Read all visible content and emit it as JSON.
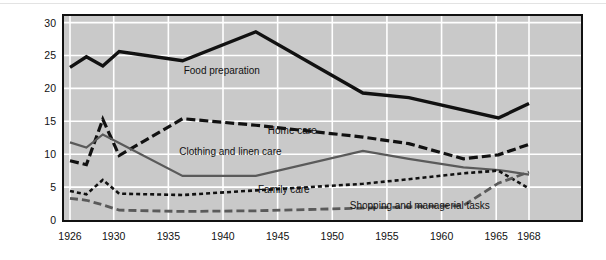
{
  "chart_data": {
    "type": "line",
    "title": "",
    "xlabel": "",
    "ylabel": "Hours per week",
    "xlim": [
      1926,
      1968
    ],
    "ylim": [
      0,
      31
    ],
    "grid": true,
    "legend_position": "inline-annotations",
    "xticks": [
      "1926",
      "1930",
      "1935",
      "1940",
      "1945",
      "1950",
      "1955",
      "1960",
      "1965",
      "1968"
    ],
    "xtick_values": [
      1926,
      1930,
      1935,
      1940,
      1945,
      1950,
      1955,
      1960,
      1965,
      1968
    ],
    "yticks": [
      "0",
      "5",
      "10",
      "15",
      "20",
      "25",
      "30"
    ],
    "ytick_values": [
      0,
      5,
      10,
      15,
      20,
      25,
      30
    ],
    "series": [
      {
        "name": "Food preparation",
        "style": "solid-thick-black",
        "color": "#111111",
        "label_x": 1936.4,
        "label_y": 22.6,
        "x": [
          1926,
          1927.5,
          1929,
          1930.5,
          1936.3,
          1943,
          1952.8,
          1957,
          1965.2,
          1968
        ],
        "values": [
          23.2,
          24.8,
          23.4,
          25.6,
          24.2,
          28.6,
          19.3,
          18.6,
          15.5,
          17.7
        ]
      },
      {
        "name": "Home care",
        "style": "dashed-long-black",
        "color": "#111111",
        "label_x": 1944.1,
        "label_y": 13.6,
        "x": [
          1926,
          1927.5,
          1929,
          1930.5,
          1936.3,
          1943,
          1952.8,
          1957,
          1962,
          1965.2,
          1968
        ],
        "values": [
          9.0,
          8.4,
          15.3,
          9.8,
          15.4,
          14.4,
          12.6,
          11.6,
          9.3,
          9.9,
          11.5
        ]
      },
      {
        "name": "Clothing and linen care",
        "style": "solid-gray",
        "color": "#5a5a5a",
        "label_x": 1936.0,
        "label_y": 10.3,
        "x": [
          1926,
          1927.5,
          1929,
          1930.5,
          1936.3,
          1943,
          1952.8,
          1957,
          1962,
          1965.2,
          1968
        ],
        "values": [
          11.8,
          11.0,
          13.0,
          11.7,
          6.7,
          6.7,
          10.5,
          9.3,
          8.0,
          7.6,
          6.9
        ]
      },
      {
        "name": "Family care",
        "style": "dashed-short-black",
        "color": "#111111",
        "label_x": 1943.2,
        "label_y": 4.6,
        "x": [
          1926,
          1927.5,
          1929,
          1930.5,
          1936.3,
          1943,
          1952.8,
          1957,
          1962,
          1965.2,
          1968
        ],
        "values": [
          4.4,
          3.9,
          6.1,
          4.0,
          3.8,
          4.5,
          5.5,
          6.2,
          7.1,
          7.5,
          4.8
        ]
      },
      {
        "name": "Shopping and managerial tasks",
        "style": "dashed-gray",
        "color": "#5a5a5a",
        "label_x": 1951.6,
        "label_y": 2.1,
        "x": [
          1926,
          1927.5,
          1929,
          1930.5,
          1936.3,
          1943,
          1952.8,
          1957,
          1962,
          1965.2,
          1968
        ],
        "values": [
          3.3,
          3.0,
          2.3,
          1.5,
          1.3,
          1.4,
          1.8,
          2.0,
          2.2,
          5.6,
          7.3
        ]
      }
    ]
  },
  "axes": {
    "y_axis_title": "Hours per week"
  }
}
